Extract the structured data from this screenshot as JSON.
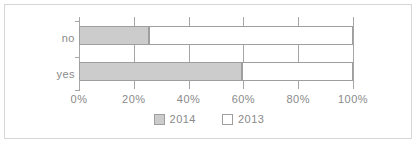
{
  "chart_data": {
    "type": "bar",
    "orientation": "horizontal",
    "stacked": true,
    "title": "",
    "xlabel": "",
    "ylabel": "",
    "categories": [
      "no",
      "yes"
    ],
    "series": [
      {
        "name": "2014",
        "values": [
          25.5,
          59.5
        ],
        "color": "#cccccc"
      },
      {
        "name": "2013",
        "values": [
          74.5,
          40.5
        ],
        "color": "#ffffff"
      }
    ],
    "xlim": [
      0,
      100
    ],
    "xticks": [
      0,
      20,
      40,
      60,
      80,
      100
    ],
    "xtick_labels": [
      "0%",
      "20%",
      "40%",
      "60%",
      "80%",
      "100%"
    ],
    "grid": true,
    "grid_axis": "x",
    "legend": [
      "2014",
      "2013"
    ],
    "legend_position": "bottom"
  },
  "axis": {
    "line_color": "#a6a6a6",
    "label_color": "#8a8a8a"
  },
  "frame": {
    "border_color": "#d6d6d6",
    "background": "#ffffff"
  }
}
